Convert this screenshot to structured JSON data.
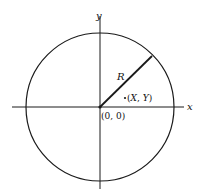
{
  "diagram": {
    "type": "circle-coordinate-diagram",
    "axes": {
      "x_label": "x",
      "y_label": "y"
    },
    "origin_label": "(0, 0)",
    "radius_label": "R",
    "point_label": "(X, Y)",
    "point_label_parts": {
      "open": "(",
      "x": "X",
      "sep": ", ",
      "y": "Y",
      "close": ")"
    },
    "colors": {
      "stroke": "#1a1a1a",
      "background": "#ffffff"
    }
  }
}
